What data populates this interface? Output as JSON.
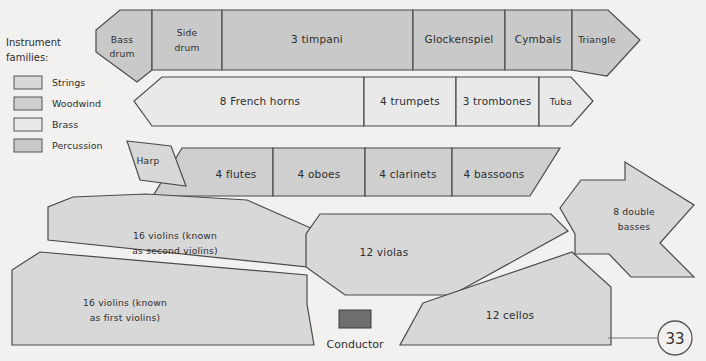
{
  "page": {
    "number": "33",
    "background_color": "#f2f1ef"
  },
  "legend": {
    "title_line1": "Instrument",
    "title_line2": "families:",
    "items": [
      {
        "label": "Strings",
        "color": "#d8d8d8"
      },
      {
        "label": "Woodwind",
        "color": "#cfcfcf"
      },
      {
        "label": "Brass",
        "color": "#e9e9e9"
      },
      {
        "label": "Percussion",
        "color": "#c9c9c9"
      }
    ]
  },
  "sections": {
    "percussion": [
      {
        "name": "bass-drum",
        "label": "Bass drum",
        "line1": "Bass",
        "line2": "drum"
      },
      {
        "name": "side-drum",
        "label": "Side drum",
        "line1": "Side",
        "line2": "drum"
      },
      {
        "name": "timpani",
        "label": "3 timpani",
        "line1": "3 timpani",
        "line2": ""
      },
      {
        "name": "glockenspiel",
        "label": "Glockenspiel",
        "line1": "Glockenspiel",
        "line2": ""
      },
      {
        "name": "cymbals",
        "label": "Cymbals",
        "line1": "Cymbals",
        "line2": ""
      },
      {
        "name": "triangle",
        "label": "Triangle",
        "line1": "Triangle",
        "line2": ""
      }
    ],
    "brass": [
      {
        "name": "french-horns",
        "label": "8 French horns"
      },
      {
        "name": "trumpets",
        "label": "4 trumpets"
      },
      {
        "name": "trombones",
        "label": "3 trombones"
      },
      {
        "name": "tuba",
        "label": "Tuba"
      }
    ],
    "woodwind": [
      {
        "name": "flutes",
        "label": "4 flutes"
      },
      {
        "name": "oboes",
        "label": "4 oboes"
      },
      {
        "name": "clarinets",
        "label": "4 clarinets"
      },
      {
        "name": "bassoons",
        "label": "4 bassoons"
      }
    ],
    "strings": [
      {
        "name": "harp",
        "label": "Harp",
        "line1": "Harp",
        "line2": ""
      },
      {
        "name": "second-violins",
        "label": "16 violins (known as second violins)",
        "line1": "16 violins (known",
        "line2": "as second violins)"
      },
      {
        "name": "first-violins",
        "label": "16 violins (known as first violins)",
        "line1": "16 violins (known",
        "line2": "as first violins)"
      },
      {
        "name": "violas",
        "label": "12 violas",
        "line1": "12 violas",
        "line2": ""
      },
      {
        "name": "cellos",
        "label": "12 cellos",
        "line1": "12 cellos",
        "line2": ""
      },
      {
        "name": "double-basses",
        "label": "8 double basses",
        "line1": "8 double",
        "line2": "basses"
      }
    ]
  },
  "conductor": {
    "label": "Conductor"
  }
}
